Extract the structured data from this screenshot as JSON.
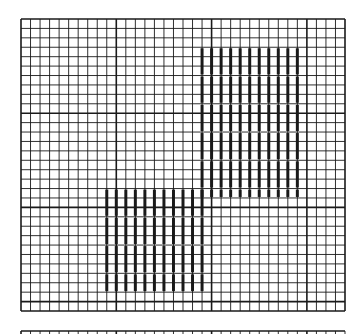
{
  "diagram": {
    "type": "needlepoint-stitch-chart",
    "background": "#ffffff",
    "line_color": "#1a1a1a",
    "main_grid": {
      "x": 21,
      "y": 19,
      "width": 324,
      "height": 292,
      "cols": 34,
      "rows": 31,
      "major_every": 10
    },
    "second_grid": {
      "x": 21,
      "y": 331,
      "width": 324,
      "cols": 34
    },
    "stitch_regions": [
      {
        "name": "upper-block",
        "col_start": 19,
        "col_end": 29,
        "row_start": 3,
        "row_end": 19
      },
      {
        "name": "lower-block",
        "col_start": 9,
        "col_end": 19,
        "row_start": 18,
        "row_end": 29
      }
    ]
  }
}
